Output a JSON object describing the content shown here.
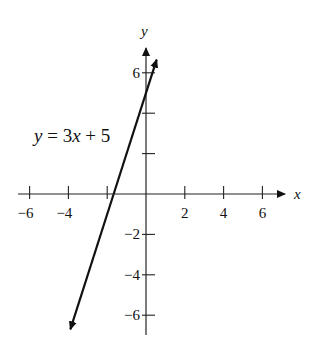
{
  "chart_data": {
    "type": "line",
    "title": "",
    "xlabel": "x",
    "ylabel": "y",
    "xlim": [
      -7,
      7
    ],
    "ylim": [
      -7,
      7
    ],
    "x_ticks": [
      -6,
      -4,
      -2,
      2,
      4,
      6
    ],
    "x_tick_labels": [
      "−6",
      "−4",
      "",
      "2",
      "4",
      "6"
    ],
    "y_ticks": [
      -6,
      -4,
      -2,
      2,
      4,
      6
    ],
    "y_tick_labels": [
      "−6",
      "−4",
      "−2",
      "",
      "",
      "6"
    ],
    "grid": false,
    "series": [
      {
        "name": "y = 3x + 5",
        "equation": "y = 3x + 5",
        "slope": 3,
        "intercept": 5,
        "x": [
          -3.9,
          0.55
        ],
        "y": [
          -6.7,
          6.65
        ]
      }
    ],
    "annotations": [
      {
        "text": "y = 3x + 5",
        "x": -5.9,
        "y": 3
      }
    ]
  },
  "labels": {
    "x_axis": "x",
    "y_axis": "y",
    "equation": "y = 3x + 5"
  }
}
